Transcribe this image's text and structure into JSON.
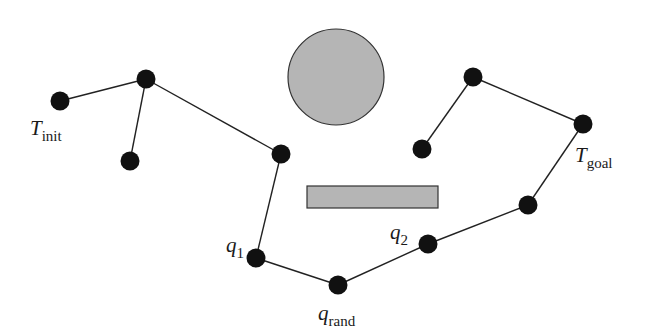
{
  "diagram": {
    "type": "rrt-connect-illustration",
    "colors": {
      "node": "#111111",
      "edge": "#222222",
      "obstacle_fill": "#b5b5b5",
      "obstacle_stroke": "#333333"
    },
    "obstacles": [
      {
        "id": "circle-obstacle",
        "shape": "circle",
        "cx": 336,
        "cy": 77,
        "r": 48
      },
      {
        "id": "rect-obstacle",
        "shape": "rect",
        "x": 307,
        "y": 186,
        "w": 131,
        "h": 22
      }
    ],
    "nodes": [
      {
        "id": "n0",
        "x": 60,
        "y": 101
      },
      {
        "id": "n1",
        "x": 146,
        "y": 79
      },
      {
        "id": "n2",
        "x": 130,
        "y": 161
      },
      {
        "id": "n3",
        "x": 281,
        "y": 154
      },
      {
        "id": "q1",
        "x": 256,
        "y": 258
      },
      {
        "id": "qrand",
        "x": 338,
        "y": 285
      },
      {
        "id": "q2",
        "x": 428,
        "y": 244
      },
      {
        "id": "n7",
        "x": 528,
        "y": 205
      },
      {
        "id": "n8",
        "x": 583,
        "y": 124
      },
      {
        "id": "n9",
        "x": 473,
        "y": 77
      },
      {
        "id": "n10",
        "x": 422,
        "y": 149
      }
    ],
    "edges": [
      [
        "n0",
        "n1"
      ],
      [
        "n1",
        "n2"
      ],
      [
        "n1",
        "n3"
      ],
      [
        "n3",
        "q1"
      ],
      [
        "q1",
        "qrand"
      ],
      [
        "qrand",
        "q2"
      ],
      [
        "q2",
        "n7"
      ],
      [
        "n7",
        "n8"
      ],
      [
        "n8",
        "n9"
      ],
      [
        "n9",
        "n10"
      ]
    ],
    "labels": [
      {
        "id": "label-t-init",
        "main": "T",
        "sub": "init",
        "x": 30,
        "y": 118
      },
      {
        "id": "label-t-goal",
        "main": "T",
        "sub": "goal",
        "x": 575,
        "y": 145
      },
      {
        "id": "label-q1",
        "main": "q",
        "sub": "1",
        "x": 226,
        "y": 235
      },
      {
        "id": "label-q2",
        "main": "q",
        "sub": "2",
        "x": 390,
        "y": 222
      },
      {
        "id": "label-q-rand",
        "main": "q",
        "sub": "rand",
        "x": 318,
        "y": 303
      }
    ]
  }
}
